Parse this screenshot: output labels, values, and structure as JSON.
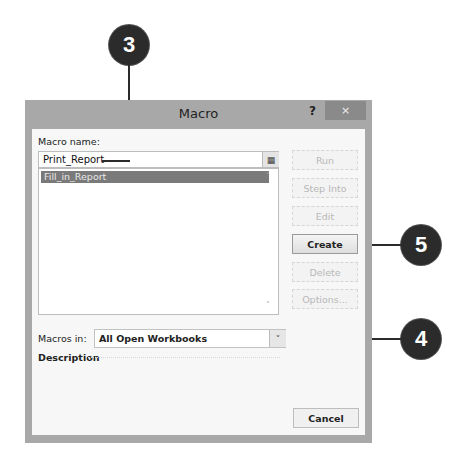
{
  "callouts": [
    {
      "number": "3",
      "target": "macro-name-field"
    },
    {
      "number": "5",
      "target": "create-button"
    },
    {
      "number": "4",
      "target": "macros-in-dropdown"
    }
  ],
  "dialog": {
    "title": "Macro",
    "help_label": "?",
    "close_label": "×",
    "macro_name_label": "Macro name:",
    "macro_name_value": "Print_Report",
    "ref_button_icon": "▦",
    "macro_list": [
      "Fill_in_Report"
    ],
    "scroll_up": "˄",
    "scroll_down": "˅",
    "buttons": {
      "run": "Run",
      "step_into": "Step Into",
      "edit": "Edit",
      "create": "Create",
      "delete": "Delete",
      "options": "Options..."
    },
    "macros_in_label": "Macros in:",
    "macros_in_value": "All Open Workbooks",
    "dropdown_arrow": "˅",
    "description_label": "Description",
    "cancel_label": "Cancel"
  }
}
